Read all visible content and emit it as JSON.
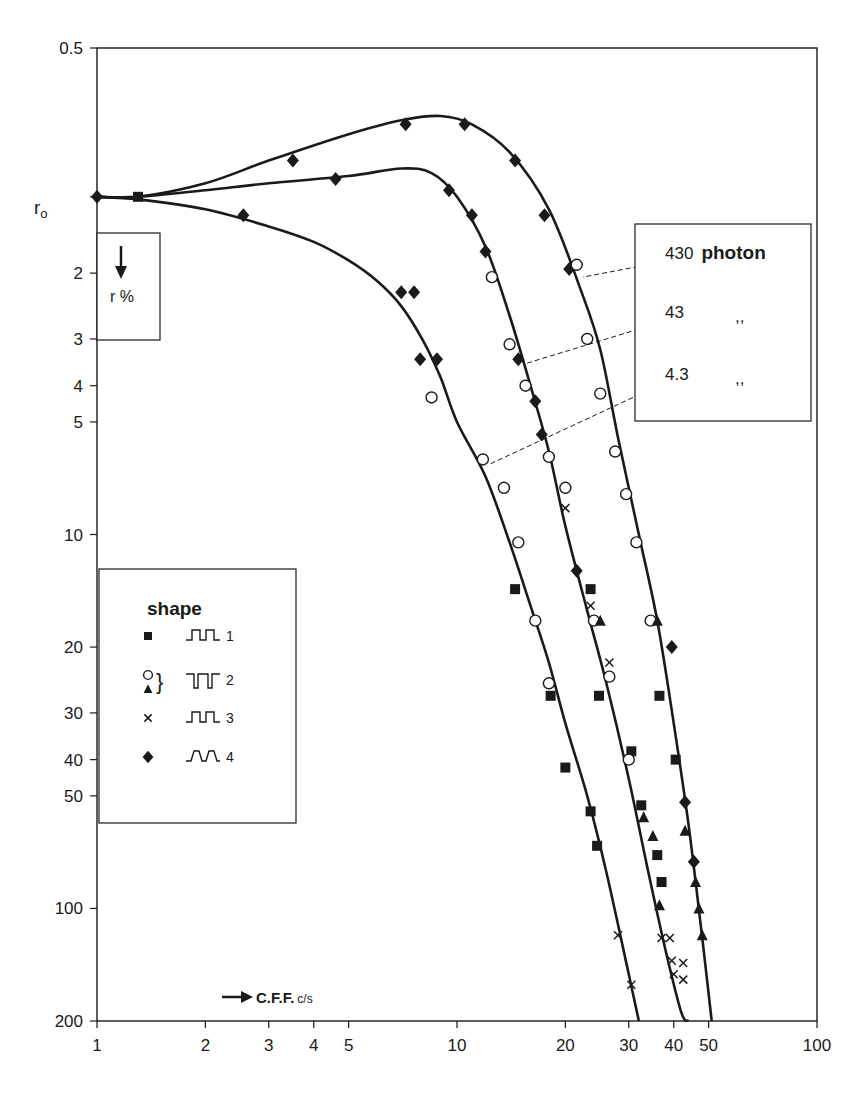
{
  "chart_data": {
    "type": "line",
    "title": "",
    "xlabel": "C.F.F. c/s",
    "ylabel": "r %",
    "x_scale": "log",
    "y_scale": "log (inverted, downward)",
    "xlim": [
      1,
      100
    ],
    "ylim": [
      0.5,
      200
    ],
    "y_reference_label": "r₀",
    "y_reference_value": 1.25,
    "x_ticks": [
      1,
      2,
      3,
      4,
      5,
      10,
      20,
      30,
      40,
      50,
      100
    ],
    "x_tick_labels": [
      "1",
      "2",
      "3",
      "4",
      "5",
      "10",
      "20",
      "30",
      "40",
      "50",
      "100"
    ],
    "y_ticks": [
      0.5,
      2,
      3,
      4,
      5,
      10,
      20,
      30,
      40,
      50,
      100,
      200
    ],
    "y_tick_labels": [
      "0.5",
      "2",
      "3",
      "4",
      "5",
      "10",
      "20",
      "30",
      "40",
      "50",
      "100",
      "200"
    ],
    "grid": false,
    "legend_position": "left-middle",
    "legend": {
      "title": "shape",
      "entries": [
        {
          "marker": "filled-square",
          "waveform": "square-pulse",
          "number": "1"
        },
        {
          "marker": "open-circle + filled-triangle",
          "waveform": "inverted-pulse",
          "number": "2"
        },
        {
          "marker": "cross",
          "waveform": "square-pulse",
          "number": "3"
        },
        {
          "marker": "filled-diamond",
          "waveform": "trapezoid-pulse",
          "number": "4"
        }
      ]
    },
    "annotations": [
      {
        "text": "430",
        "unit": "photon",
        "curve": "right"
      },
      {
        "text": "43",
        "unit": "”",
        "curve": "middle"
      },
      {
        "text": "4.3",
        "unit": "”",
        "curve": "left"
      }
    ],
    "series": [
      {
        "name": "430 photon",
        "curve": {
          "x": [
            1,
            1.3,
            2,
            3,
            5,
            7,
            9,
            11,
            14,
            18,
            22,
            25,
            28,
            32,
            36,
            40,
            44,
            48,
            51
          ],
          "y": [
            1.25,
            1.25,
            1.15,
            1.0,
            0.85,
            0.78,
            0.76,
            0.8,
            0.95,
            1.35,
            2.2,
            3.2,
            5.5,
            10,
            17,
            32,
            60,
            120,
            200
          ]
        },
        "points": [
          {
            "marker": "diamond",
            "x": 3.5,
            "y": 1.0
          },
          {
            "marker": "diamond",
            "x": 7.2,
            "y": 0.8
          },
          {
            "marker": "diamond",
            "x": 10.5,
            "y": 0.8
          },
          {
            "marker": "diamond",
            "x": 14.5,
            "y": 1.0
          },
          {
            "marker": "diamond",
            "x": 17.5,
            "y": 1.4
          },
          {
            "marker": "diamond",
            "x": 20.5,
            "y": 1.95
          },
          {
            "marker": "circle",
            "x": 21.5,
            "y": 1.9
          },
          {
            "marker": "circle",
            "x": 23,
            "y": 3.0
          },
          {
            "marker": "circle",
            "x": 25,
            "y": 4.2
          },
          {
            "marker": "circle",
            "x": 27.5,
            "y": 6.0
          },
          {
            "marker": "circle",
            "x": 29.5,
            "y": 7.8
          },
          {
            "marker": "circle",
            "x": 31.5,
            "y": 10.5
          },
          {
            "marker": "circle",
            "x": 34.5,
            "y": 17
          },
          {
            "marker": "triangle",
            "x": 36,
            "y": 17
          },
          {
            "marker": "square",
            "x": 36.5,
            "y": 27
          },
          {
            "marker": "diamond",
            "x": 39.5,
            "y": 20
          },
          {
            "marker": "square",
            "x": 40.5,
            "y": 40
          },
          {
            "marker": "diamond",
            "x": 43,
            "y": 52
          },
          {
            "marker": "triangle",
            "x": 43,
            "y": 62
          },
          {
            "marker": "diamond",
            "x": 45.5,
            "y": 75
          },
          {
            "marker": "triangle",
            "x": 46,
            "y": 85
          },
          {
            "marker": "triangle",
            "x": 47,
            "y": 100
          },
          {
            "marker": "triangle",
            "x": 48,
            "y": 118
          },
          {
            "marker": "cross",
            "x": 42.5,
            "y": 140
          },
          {
            "marker": "cross",
            "x": 42.5,
            "y": 155
          }
        ]
      },
      {
        "name": "43 photon",
        "curve": {
          "x": [
            1,
            1.3,
            2,
            3,
            5,
            7,
            8.5,
            10,
            12,
            14,
            16,
            18,
            20,
            23,
            26,
            30,
            34,
            38,
            42,
            44
          ],
          "y": [
            1.25,
            1.25,
            1.2,
            1.15,
            1.1,
            1.05,
            1.08,
            1.25,
            1.7,
            2.6,
            4.0,
            6.0,
            9.5,
            16,
            25,
            45,
            80,
            130,
            190,
            200
          ]
        },
        "points": [
          {
            "marker": "diamond",
            "x": 4.6,
            "y": 1.12
          },
          {
            "marker": "diamond",
            "x": 9.5,
            "y": 1.2
          },
          {
            "marker": "diamond",
            "x": 11,
            "y": 1.4
          },
          {
            "marker": "diamond",
            "x": 12,
            "y": 1.75
          },
          {
            "marker": "circle",
            "x": 12.5,
            "y": 2.05
          },
          {
            "marker": "circle",
            "x": 14,
            "y": 3.1
          },
          {
            "marker": "diamond",
            "x": 14.8,
            "y": 3.4
          },
          {
            "marker": "circle",
            "x": 15.5,
            "y": 4.0
          },
          {
            "marker": "diamond",
            "x": 16.5,
            "y": 4.4
          },
          {
            "marker": "diamond",
            "x": 17.2,
            "y": 5.4
          },
          {
            "marker": "circle",
            "x": 18,
            "y": 6.2
          },
          {
            "marker": "circle",
            "x": 20,
            "y": 7.5
          },
          {
            "marker": "cross",
            "x": 20,
            "y": 8.5
          },
          {
            "marker": "diamond",
            "x": 21.5,
            "y": 12.5
          },
          {
            "marker": "square",
            "x": 23.5,
            "y": 14
          },
          {
            "marker": "cross",
            "x": 23.5,
            "y": 15.5
          },
          {
            "marker": "circle",
            "x": 24,
            "y": 17
          },
          {
            "marker": "triangle",
            "x": 25,
            "y": 17
          },
          {
            "marker": "cross",
            "x": 26.5,
            "y": 22
          },
          {
            "marker": "circle",
            "x": 26.5,
            "y": 24
          },
          {
            "marker": "square",
            "x": 24.8,
            "y": 27
          },
          {
            "marker": "square",
            "x": 30.5,
            "y": 38
          },
          {
            "marker": "circle",
            "x": 30,
            "y": 40
          },
          {
            "marker": "square",
            "x": 32.5,
            "y": 53
          },
          {
            "marker": "triangle",
            "x": 33,
            "y": 57
          },
          {
            "marker": "triangle",
            "x": 35,
            "y": 64
          },
          {
            "marker": "square",
            "x": 36,
            "y": 72
          },
          {
            "marker": "square",
            "x": 37,
            "y": 85
          },
          {
            "marker": "triangle",
            "x": 36.5,
            "y": 98
          },
          {
            "marker": "cross",
            "x": 37,
            "y": 120
          },
          {
            "marker": "cross",
            "x": 39,
            "y": 120
          },
          {
            "marker": "cross",
            "x": 39.5,
            "y": 138
          },
          {
            "marker": "cross",
            "x": 40,
            "y": 150
          }
        ]
      },
      {
        "name": "4.3 photon",
        "curve": {
          "x": [
            1,
            1.3,
            2,
            3,
            4,
            5,
            6,
            7,
            8,
            9,
            10,
            12,
            14,
            16,
            18,
            20,
            23,
            26,
            30,
            32
          ],
          "y": [
            1.25,
            1.27,
            1.35,
            1.5,
            1.65,
            1.85,
            2.1,
            2.45,
            3.0,
            3.8,
            5.0,
            7.0,
            10.5,
            15.5,
            22,
            32,
            50,
            80,
            150,
            200
          ]
        },
        "points": [
          {
            "marker": "diamond",
            "x": 1,
            "y": 1.25
          },
          {
            "marker": "square",
            "x": 1.3,
            "y": 1.25
          },
          {
            "marker": "diamond",
            "x": 2.55,
            "y": 1.4
          },
          {
            "marker": "diamond",
            "x": 7.0,
            "y": 2.25
          },
          {
            "marker": "diamond",
            "x": 7.6,
            "y": 2.25
          },
          {
            "marker": "diamond",
            "x": 7.9,
            "y": 3.4
          },
          {
            "marker": "diamond",
            "x": 8.8,
            "y": 3.4
          },
          {
            "marker": "circle",
            "x": 8.5,
            "y": 4.3
          },
          {
            "marker": "circle",
            "x": 11.8,
            "y": 6.3
          },
          {
            "marker": "circle",
            "x": 13.5,
            "y": 7.5
          },
          {
            "marker": "circle",
            "x": 14.8,
            "y": 10.5
          },
          {
            "marker": "square",
            "x": 14.5,
            "y": 14
          },
          {
            "marker": "circle",
            "x": 16.5,
            "y": 17
          },
          {
            "marker": "circle",
            "x": 18,
            "y": 25
          },
          {
            "marker": "square",
            "x": 18.2,
            "y": 27
          },
          {
            "marker": "square",
            "x": 20,
            "y": 42
          },
          {
            "marker": "square",
            "x": 23.5,
            "y": 55
          },
          {
            "marker": "square",
            "x": 24.5,
            "y": 68
          },
          {
            "marker": "cross",
            "x": 28,
            "y": 118
          },
          {
            "marker": "cross",
            "x": 30.5,
            "y": 160
          }
        ]
      }
    ]
  },
  "labels": {
    "y_ref": "r",
    "y_ref_sub": "o",
    "y_axis_label": "r %",
    "x_axis_label": "C.F.F.",
    "x_axis_unit": "c/s",
    "legend_title": "shape",
    "photon_word": "photon",
    "ditto": ",,"
  }
}
